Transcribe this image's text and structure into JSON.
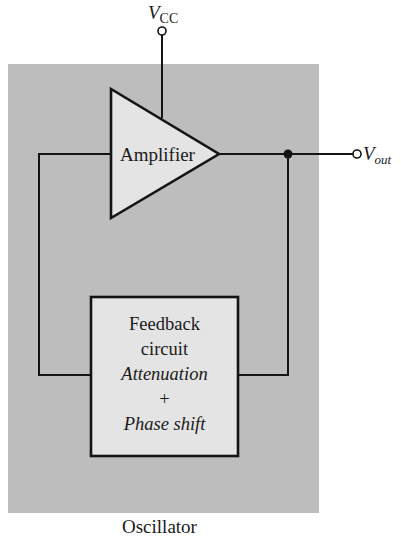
{
  "diagram": {
    "title": "Oscillator",
    "colors": {
      "background": "#ffffff",
      "enclosure_fill": "#bdbdbd",
      "block_fill": "#e4e4e4",
      "line": "#141414"
    },
    "supply": {
      "symbol": "V",
      "subscript": "CC"
    },
    "output": {
      "symbol": "V",
      "subscript": "out"
    },
    "amplifier": {
      "label": "Amplifier",
      "shape": "triangle"
    },
    "feedback_block": {
      "line1": "Feedback",
      "line2": "circuit",
      "line3": "Attenuation",
      "line4": "+",
      "line5": "Phase shift"
    },
    "connections": [
      {
        "from": "V_CC terminal",
        "to": "Amplifier supply"
      },
      {
        "from": "Amplifier output",
        "to": "junction node"
      },
      {
        "from": "junction node",
        "to": "V_out terminal"
      },
      {
        "from": "junction node",
        "to": "Feedback circuit (right side)"
      },
      {
        "from": "Feedback circuit (left side)",
        "to": "Amplifier input"
      }
    ]
  }
}
